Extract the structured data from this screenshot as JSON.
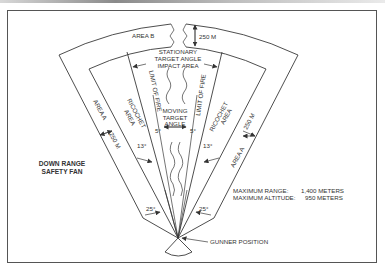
{
  "diagram": {
    "title_lines": [
      "DOWN RANGE",
      "SAFETY FAN"
    ],
    "areas": {
      "area_b": "AREA B",
      "area_b_depth": "250 M",
      "stationary_lines": [
        "STATIONARY",
        "TARGET ANGLE",
        "IMPACT AREA"
      ],
      "limit_of_fire_left": "LIMIT OF FIRE",
      "limit_of_fire_right": "LIMIT OF FIRE",
      "moving_lines": [
        "MOVING",
        "TARGET",
        "ANGLE"
      ],
      "ricochet_left_lines": [
        "RICOCHET",
        "AREA"
      ],
      "ricochet_right_lines": [
        "RICOCHET",
        "AREA"
      ],
      "area_a_left": "AREA A",
      "area_a_right": "AREA A",
      "area_a_left_depth": "250 M",
      "area_a_right_depth": "250 M"
    },
    "angles": {
      "moving_left": "5°",
      "moving_right": "5°",
      "ricochet_left": "13°",
      "ricochet_right": "13°",
      "area_a_left": "25°",
      "area_a_right": "25°"
    },
    "specs": {
      "max_range_label": "MAXIMUM RANGE:",
      "max_range_value": "1,400 METERS",
      "max_altitude_label": "MAXIMUM ALTITUDE:",
      "max_altitude_value": "950 METERS"
    },
    "gunner_label": "GUNNER POSITION"
  }
}
